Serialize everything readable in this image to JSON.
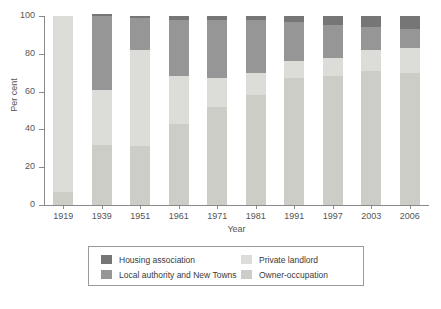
{
  "chart_data": {
    "type": "bar",
    "title": "",
    "xlabel": "Year",
    "ylabel": "Per cent",
    "ylim": [
      0,
      100
    ],
    "yticks": [
      0,
      20,
      40,
      60,
      80,
      100
    ],
    "stacked": true,
    "grid": false,
    "legend_position": "bottom",
    "categories": [
      "1919",
      "1939",
      "1951",
      "1961",
      "1971",
      "1981",
      "1991",
      "1997",
      "2003",
      "2006"
    ],
    "series": [
      {
        "name": "Owner-occupation",
        "color": "#cdcdc7",
        "values": [
          7,
          32,
          31,
          43,
          52,
          58,
          67,
          68,
          71,
          70
        ]
      },
      {
        "name": "Private landlord",
        "color": "#dcdcd8",
        "values": [
          93,
          29,
          51,
          25,
          15,
          12,
          9,
          10,
          11,
          13
        ]
      },
      {
        "name": "Local authority and New Towns",
        "color": "#969696",
        "values": [
          0,
          39,
          17,
          30,
          31,
          28,
          21,
          17,
          12,
          10
        ]
      },
      {
        "name": "Housing association",
        "color": "#767676",
        "values": [
          0,
          1,
          1,
          2,
          2,
          2,
          3,
          5,
          6,
          7
        ]
      }
    ]
  },
  "axes": {
    "y_title": "Per cent",
    "x_title": "Year"
  },
  "legend": {
    "left_column": [
      {
        "label": "Housing association",
        "color": "#767676"
      },
      {
        "label": "Local authority and New Towns",
        "color": "#969696"
      }
    ],
    "right_column": [
      {
        "label": "Private landlord",
        "color": "#dcdcd8"
      },
      {
        "label": "Owner-occupation",
        "color": "#cdcdc7"
      }
    ]
  },
  "caption": {
    "cut_off_text": ""
  }
}
